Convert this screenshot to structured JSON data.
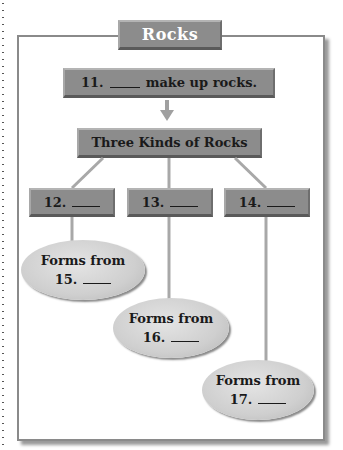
{
  "diagram": {
    "title": "Rocks",
    "top_box": {
      "number": "11.",
      "text": "make up rocks."
    },
    "middle_box": {
      "text": "Three Kinds of Rocks"
    },
    "kinds": [
      {
        "number": "12."
      },
      {
        "number": "13."
      },
      {
        "number": "14."
      }
    ],
    "origins": [
      {
        "label": "Forms from",
        "number": "15."
      },
      {
        "label": "Forms from",
        "number": "16."
      },
      {
        "label": "Forms from",
        "number": "17."
      }
    ]
  },
  "colors": {
    "box_fill": "#8c8c8c",
    "ellipse_fill": "#d4d4d4",
    "connector": "#a8a8a8",
    "frame": "#8a8a8a"
  }
}
